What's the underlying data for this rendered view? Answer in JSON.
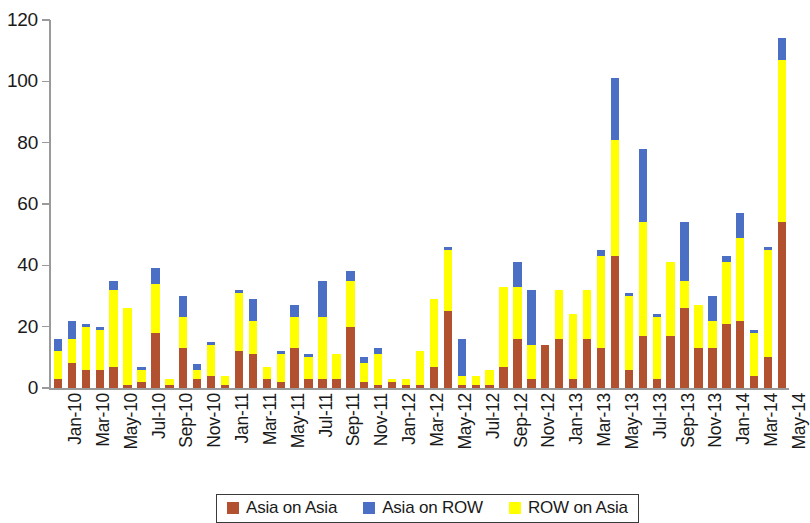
{
  "chart_data": {
    "type": "bar",
    "subtype": "stacked-column",
    "title": "",
    "xlabel": "",
    "ylabel": "",
    "ylim": [
      0,
      120
    ],
    "yticks": [
      0,
      20,
      40,
      60,
      80,
      100,
      120
    ],
    "grid": false,
    "legend_position": "bottom",
    "colors": {
      "Asia on Asia": "#b1512f",
      "Asia on ROW": "#4a6fc4",
      "ROW on Asia": "#ffff00"
    },
    "categories": [
      "Jan-10",
      "Feb-10",
      "Mar-10",
      "Apr-10",
      "May-10",
      "Jun-10",
      "Jul-10",
      "Aug-10",
      "Sep-10",
      "Oct-10",
      "Nov-10",
      "Dec-10",
      "Jan-11",
      "Feb-11",
      "Mar-11",
      "Apr-11",
      "May-11",
      "Jun-11",
      "Jul-11",
      "Aug-11",
      "Sep-11",
      "Oct-11",
      "Nov-11",
      "Dec-11",
      "Jan-12",
      "Feb-12",
      "Mar-12",
      "Apr-12",
      "May-12",
      "Jun-12",
      "Jul-12",
      "Aug-12",
      "Sep-12",
      "Oct-12",
      "Nov-12",
      "Dec-12",
      "Jan-13",
      "Feb-13",
      "Mar-13",
      "Apr-13",
      "May-13",
      "Jun-13",
      "Jul-13",
      "Aug-13",
      "Sep-13",
      "Oct-13",
      "Nov-13",
      "Dec-13",
      "Jan-14",
      "Feb-14",
      "Mar-14",
      "Apr-14",
      "May-14"
    ],
    "tick_labels": [
      "Jan-10",
      "Mar-10",
      "May-10",
      "Jul-10",
      "Sep-10",
      "Nov-10",
      "Jan-11",
      "Mar-11",
      "May-11",
      "Jul-11",
      "Sep-11",
      "Nov-11",
      "Jan-12",
      "Mar-12",
      "May-12",
      "Jul-12",
      "Sep-12",
      "Nov-12",
      "Jan-13",
      "Mar-13",
      "May-13",
      "Jul-13",
      "Sep-13",
      "Nov-13",
      "Jan-14",
      "Mar-14",
      "May-14"
    ],
    "series": [
      {
        "name": "Asia on Asia",
        "color": "#b1512f",
        "values": [
          3,
          8,
          6,
          7,
          2,
          18,
          13,
          3,
          4,
          1,
          12,
          11,
          3,
          2,
          13,
          3,
          3,
          20,
          3,
          2,
          1,
          1,
          7,
          25,
          1,
          1,
          7,
          16,
          3,
          16,
          16,
          13,
          43,
          6,
          17,
          3,
          17,
          26,
          13,
          13,
          21,
          23,
          10,
          54,
          2,
          1,
          2,
          1,
          1,
          1,
          1,
          1,
          1
        ]
      },
      {
        "name": "ROW on Asia",
        "color": "#ffff00",
        "values": [
          9,
          12,
          14,
          26,
          4,
          16,
          9,
          11,
          3,
          11,
          19,
          8,
          8,
          5,
          10,
          8,
          3,
          16,
          8,
          12,
          2,
          3,
          22,
          20,
          3,
          3,
          5,
          17,
          11,
          14,
          16,
          18,
          38,
          48,
          37,
          20,
          18,
          8,
          22,
          36,
          28,
          10,
          3,
          53,
          2,
          1,
          1,
          1,
          1,
          1,
          1,
          1,
          1
        ]
      },
      {
        "name": "Asia on ROW",
        "color": "#4a6fc4",
        "values": [
          4,
          2,
          0,
          1,
          1,
          5,
          7,
          0,
          7,
          2,
          1,
          9,
          1,
          3,
          12,
          0,
          5,
          2,
          2,
          0,
          0,
          9,
          4,
          1,
          0,
          0,
          0,
          8,
          18,
          2,
          10,
          1,
          20,
          24,
          8,
          18,
          10,
          20,
          9,
          8,
          8,
          1,
          5,
          7,
          1,
          0,
          0,
          0,
          0,
          0,
          0,
          0,
          0
        ]
      }
    ],
    "bars": [
      {
        "label": "Jan-10",
        "asia_on_asia": 3,
        "row_on_asia": 9,
        "asia_on_row": 4,
        "total": 16
      },
      {
        "label": "Feb-10",
        "asia_on_asia": 8,
        "row_on_asia": 8,
        "asia_on_row": 6,
        "total": 22
      },
      {
        "label": "Mar-10",
        "asia_on_asia": 6,
        "row_on_asia": 14,
        "asia_on_row": 1,
        "total": 21
      },
      {
        "label": "Apr-10",
        "asia_on_asia": 6,
        "row_on_asia": 13,
        "asia_on_row": 1,
        "total": 20
      },
      {
        "label": "May-10",
        "asia_on_asia": 7,
        "row_on_asia": 25,
        "asia_on_row": 3,
        "total": 35
      },
      {
        "label": "Jun-10",
        "asia_on_asia": 1,
        "row_on_asia": 25,
        "asia_on_row": 0,
        "total": 26
      },
      {
        "label": "Jul-10",
        "asia_on_asia": 2,
        "row_on_asia": 4,
        "asia_on_row": 1,
        "total": 7
      },
      {
        "label": "Aug-10",
        "asia_on_asia": 18,
        "row_on_asia": 16,
        "asia_on_row": 5,
        "total": 39
      },
      {
        "label": "Sep-10",
        "asia_on_asia": 1,
        "row_on_asia": 2,
        "asia_on_row": 0,
        "total": 3
      },
      {
        "label": "Oct-10",
        "asia_on_asia": 13,
        "row_on_asia": 10,
        "asia_on_row": 7,
        "total": 30
      },
      {
        "label": "Nov-10",
        "asia_on_asia": 3,
        "row_on_asia": 3,
        "asia_on_row": 2,
        "total": 8
      },
      {
        "label": "Dec-10",
        "asia_on_asia": 4,
        "row_on_asia": 10,
        "asia_on_row": 1,
        "total": 15
      },
      {
        "label": "Jan-11",
        "asia_on_asia": 1,
        "row_on_asia": 3,
        "asia_on_row": 0,
        "total": 4
      },
      {
        "label": "Feb-11",
        "asia_on_asia": 12,
        "row_on_asia": 19,
        "asia_on_row": 1,
        "total": 32
      },
      {
        "label": "Mar-11",
        "asia_on_asia": 11,
        "row_on_asia": 11,
        "asia_on_row": 7,
        "total": 29
      },
      {
        "label": "Apr-11",
        "asia_on_asia": 3,
        "row_on_asia": 4,
        "asia_on_row": 0,
        "total": 7
      },
      {
        "label": "May-11",
        "asia_on_asia": 2,
        "row_on_asia": 9,
        "asia_on_row": 1,
        "total": 12
      },
      {
        "label": "Jun-11",
        "asia_on_asia": 13,
        "row_on_asia": 10,
        "asia_on_row": 4,
        "total": 27
      },
      {
        "label": "Jul-11",
        "asia_on_asia": 3,
        "row_on_asia": 7,
        "asia_on_row": 1,
        "total": 11
      },
      {
        "label": "Aug-11",
        "asia_on_asia": 3,
        "row_on_asia": 20,
        "asia_on_row": 12,
        "total": 35
      },
      {
        "label": "Sep-11",
        "asia_on_asia": 3,
        "row_on_asia": 8,
        "asia_on_row": 0,
        "total": 11
      },
      {
        "label": "Oct-11",
        "asia_on_asia": 20,
        "row_on_asia": 15,
        "asia_on_row": 3,
        "total": 38
      },
      {
        "label": "Nov-11",
        "asia_on_asia": 2,
        "row_on_asia": 6,
        "asia_on_row": 2,
        "total": 10
      },
      {
        "label": "Dec-11",
        "asia_on_asia": 1,
        "row_on_asia": 10,
        "asia_on_row": 2,
        "total": 13
      },
      {
        "label": "Jan-12",
        "asia_on_asia": 2,
        "row_on_asia": 1,
        "asia_on_row": 0,
        "total": 3
      },
      {
        "label": "Feb-12",
        "asia_on_asia": 1,
        "row_on_asia": 2,
        "asia_on_row": 0,
        "total": 3
      },
      {
        "label": "Mar-12",
        "asia_on_asia": 1,
        "row_on_asia": 11,
        "asia_on_row": 0,
        "total": 12
      },
      {
        "label": "Apr-12",
        "asia_on_asia": 7,
        "row_on_asia": 22,
        "asia_on_row": 0,
        "total": 29
      },
      {
        "label": "May-12",
        "asia_on_asia": 25,
        "row_on_asia": 20,
        "asia_on_row": 1,
        "total": 46
      },
      {
        "label": "Jun-12",
        "asia_on_asia": 1,
        "row_on_asia": 3,
        "asia_on_row": 12,
        "total": 16
      },
      {
        "label": "Jul-12",
        "asia_on_asia": 1,
        "row_on_asia": 3,
        "asia_on_row": 0,
        "total": 4
      },
      {
        "label": "Aug-12",
        "asia_on_asia": 1,
        "row_on_asia": 5,
        "asia_on_row": 0,
        "total": 6
      },
      {
        "label": "Sep-12",
        "asia_on_asia": 7,
        "row_on_asia": 26,
        "asia_on_row": 0,
        "total": 33
      },
      {
        "label": "Oct-12",
        "asia_on_asia": 16,
        "row_on_asia": 17,
        "asia_on_row": 8,
        "total": 41
      },
      {
        "label": "Nov-12",
        "asia_on_asia": 3,
        "row_on_asia": 11,
        "asia_on_row": 18,
        "total": 32
      },
      {
        "label": "Dec-12",
        "asia_on_asia": 14,
        "row_on_asia": 0,
        "asia_on_row": 0,
        "total": 14
      },
      {
        "label": "Jan-13",
        "asia_on_asia": 16,
        "row_on_asia": 16,
        "asia_on_row": 0,
        "total": 32
      },
      {
        "label": "Feb-13",
        "asia_on_asia": 3,
        "row_on_asia": 21,
        "asia_on_row": 0,
        "total": 24
      },
      {
        "label": "Mar-13",
        "asia_on_asia": 16,
        "row_on_asia": 16,
        "asia_on_row": 0,
        "total": 32
      },
      {
        "label": "Apr-13",
        "asia_on_asia": 13,
        "row_on_asia": 30,
        "asia_on_row": 2,
        "total": 45
      },
      {
        "label": "May-13",
        "asia_on_asia": 43,
        "row_on_asia": 38,
        "asia_on_row": 20,
        "total": 101
      },
      {
        "label": "Jun-13",
        "asia_on_asia": 6,
        "row_on_asia": 24,
        "asia_on_row": 1,
        "total": 31
      },
      {
        "label": "Jul-13",
        "asia_on_asia": 17,
        "row_on_asia": 37,
        "asia_on_row": 24,
        "total": 78
      },
      {
        "label": "Aug-13",
        "asia_on_asia": 3,
        "row_on_asia": 20,
        "asia_on_row": 1,
        "total": 24
      },
      {
        "label": "Sep-13",
        "asia_on_asia": 17,
        "row_on_asia": 24,
        "asia_on_row": 0,
        "total": 41
      },
      {
        "label": "Oct-13",
        "asia_on_asia": 26,
        "row_on_asia": 9,
        "asia_on_row": 19,
        "total": 54
      },
      {
        "label": "Nov-13",
        "asia_on_asia": 13,
        "row_on_asia": 14,
        "asia_on_row": 0,
        "total": 27
      },
      {
        "label": "Dec-13",
        "asia_on_asia": 13,
        "row_on_asia": 9,
        "asia_on_row": 8,
        "total": 30
      },
      {
        "label": "Jan-14",
        "asia_on_asia": 21,
        "row_on_asia": 20,
        "asia_on_row": 2,
        "total": 43
      },
      {
        "label": "Feb-14",
        "asia_on_asia": 22,
        "row_on_asia": 27,
        "asia_on_row": 8,
        "total": 57
      },
      {
        "label": "Mar-14",
        "asia_on_asia": 4,
        "row_on_asia": 14,
        "asia_on_row": 1,
        "total": 19
      },
      {
        "label": "Apr-14",
        "asia_on_asia": 10,
        "row_on_asia": 35,
        "asia_on_row": 1,
        "total": 46
      },
      {
        "label": "May-14",
        "asia_on_asia": 54,
        "row_on_asia": 53,
        "asia_on_row": 7,
        "total": 114
      }
    ]
  },
  "axis": {
    "y_tick_labels": [
      "0",
      "20",
      "40",
      "60",
      "80",
      "100",
      "120"
    ]
  },
  "legend": {
    "items": [
      {
        "label": "Asia on Asia",
        "color": "#b1512f",
        "key": "asia-on-asia"
      },
      {
        "label": "Asia on ROW",
        "color": "#4a6fc4",
        "key": "asia-on-row"
      },
      {
        "label": "ROW on Asia",
        "color": "#ffff00",
        "key": "row-on-asia"
      }
    ]
  }
}
